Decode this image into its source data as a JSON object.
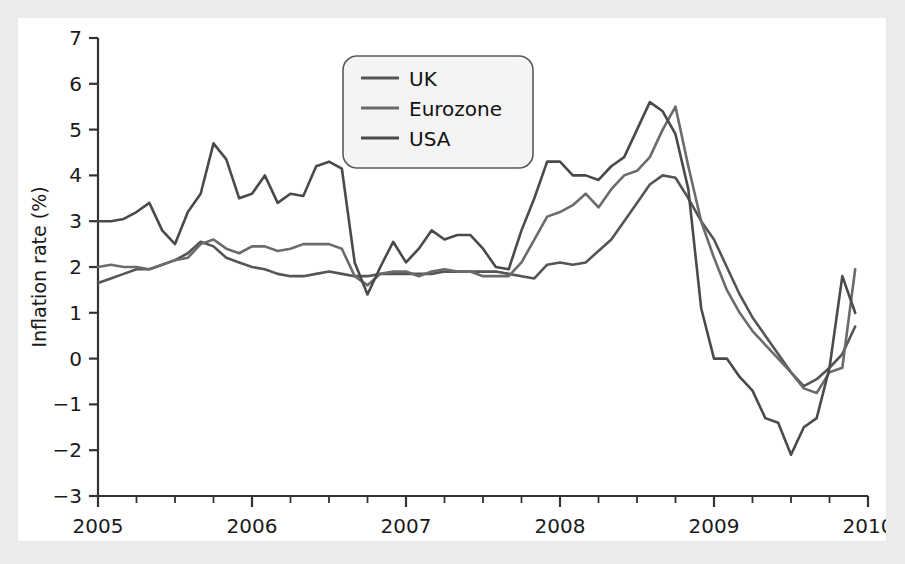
{
  "figure": {
    "background_color": "#ebebeb",
    "panel_color": "#ffffff"
  },
  "chart_data": {
    "type": "line",
    "title": "",
    "xlabel": "",
    "ylabel": "Inflation rate (%)",
    "xlim": [
      2005,
      2010
    ],
    "ylim": [
      -3,
      7
    ],
    "grid": false,
    "legend_position": "top-center",
    "x_tick_labels": [
      "2005",
      "2006",
      "2007",
      "2008",
      "2009",
      "2010"
    ],
    "x_tick_values": [
      2005,
      2006,
      2007,
      2008,
      2009,
      2010
    ],
    "x_minor_ticks_per_interval": 4,
    "y_tick_labels": [
      "-3",
      "-2",
      "-1",
      "0",
      "1",
      "2",
      "3",
      "4",
      "5",
      "6",
      "7"
    ],
    "y_tick_values": [
      -3,
      -2,
      -1,
      0,
      1,
      2,
      3,
      4,
      5,
      6,
      7
    ],
    "x": [
      2005.0,
      2005.0833,
      2005.1667,
      2005.25,
      2005.3333,
      2005.4167,
      2005.5,
      2005.5833,
      2005.6667,
      2005.75,
      2005.8333,
      2005.9167,
      2006.0,
      2006.0833,
      2006.1667,
      2006.25,
      2006.3333,
      2006.4167,
      2006.5,
      2006.5833,
      2006.6667,
      2006.75,
      2006.8333,
      2006.9167,
      2007.0,
      2007.0833,
      2007.1667,
      2007.25,
      2007.3333,
      2007.4167,
      2007.5,
      2007.5833,
      2007.6667,
      2007.75,
      2007.8333,
      2007.9167,
      2008.0,
      2008.0833,
      2008.1667,
      2008.25,
      2008.3333,
      2008.4167,
      2008.5,
      2008.5833,
      2008.6667,
      2008.75,
      2008.8333,
      2008.9167,
      2009.0,
      2009.0833,
      2009.1667,
      2009.25,
      2009.3333,
      2009.4167,
      2009.5,
      2009.5833,
      2009.6667,
      2009.75,
      2009.8333,
      2009.9167
    ],
    "series": [
      {
        "name": "UK",
        "color": "#555555",
        "values": [
          1.65,
          1.75,
          1.85,
          1.95,
          1.95,
          2.05,
          2.15,
          2.3,
          2.55,
          2.45,
          2.2,
          2.1,
          2.0,
          1.95,
          1.85,
          1.8,
          1.8,
          1.85,
          1.9,
          1.85,
          1.8,
          1.8,
          1.85,
          1.85,
          1.85,
          1.85,
          1.85,
          1.9,
          1.9,
          1.9,
          1.9,
          1.9,
          1.85,
          1.8,
          1.75,
          2.05,
          2.1,
          2.05,
          2.1,
          2.35,
          2.6,
          3.0,
          3.4,
          3.8,
          4.0,
          3.95,
          3.5,
          3.0,
          2.6,
          2.0,
          1.4,
          0.9,
          0.5,
          0.1,
          -0.3,
          -0.6,
          -0.45,
          -0.2,
          0.1,
          0.7
        ]
      },
      {
        "name": "Eurozone",
        "color": "#6b6b6b",
        "values": [
          2.0,
          2.05,
          2.0,
          2.0,
          1.95,
          2.05,
          2.15,
          2.2,
          2.5,
          2.6,
          2.4,
          2.3,
          2.45,
          2.45,
          2.35,
          2.4,
          2.5,
          2.5,
          2.5,
          2.4,
          1.8,
          1.6,
          1.85,
          1.9,
          1.9,
          1.8,
          1.9,
          1.95,
          1.9,
          1.9,
          1.8,
          1.8,
          1.8,
          2.1,
          2.6,
          3.1,
          3.2,
          3.35,
          3.6,
          3.3,
          3.7,
          4.0,
          4.1,
          4.4,
          5.0,
          5.5,
          4.2,
          3.0,
          2.2,
          1.5,
          1.0,
          0.6,
          0.3,
          0.0,
          -0.3,
          -0.65,
          -0.75,
          -0.3,
          -0.2,
          1.95
        ]
      },
      {
        "name": "USA",
        "color": "#4a4a4a",
        "values": [
          3.0,
          3.0,
          3.05,
          3.2,
          3.4,
          2.8,
          2.5,
          3.2,
          3.6,
          4.7,
          4.35,
          3.5,
          3.6,
          4.0,
          3.4,
          3.6,
          3.55,
          4.2,
          4.3,
          4.15,
          2.1,
          1.4,
          2.0,
          2.55,
          2.1,
          2.4,
          2.8,
          2.6,
          2.7,
          2.7,
          2.4,
          2.0,
          1.95,
          2.8,
          3.5,
          4.3,
          4.3,
          4.0,
          4.0,
          3.9,
          4.2,
          4.4,
          5.0,
          5.6,
          5.4,
          4.9,
          3.7,
          1.1,
          0.0,
          0.0,
          -0.4,
          -0.7,
          -1.3,
          -1.4,
          -2.1,
          -1.5,
          -1.3,
          -0.2,
          1.8,
          1.0
        ]
      }
    ]
  },
  "axes": {
    "y_title": "Inflation rate (%)"
  },
  "legend": {
    "entries": [
      {
        "label": "UK"
      },
      {
        "label": "Eurozone"
      },
      {
        "label": "USA"
      }
    ]
  }
}
